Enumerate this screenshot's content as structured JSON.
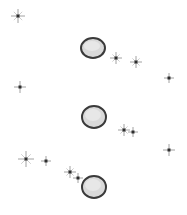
{
  "canvas": {
    "width": 187,
    "height": 215,
    "background": "#ffffff"
  },
  "colors": {
    "disc_rim": "#3a3a3a",
    "disc_fill": "#d9d9d9",
    "disc_highlight": "#ececec",
    "star_core": "#2e2e2e",
    "star_rays": "#8a8a8a"
  },
  "discs": [
    {
      "id": "disc-top",
      "cx": 93,
      "cy": 48,
      "rx": 12,
      "ry": 10
    },
    {
      "id": "disc-middle",
      "cx": 94,
      "cy": 117,
      "rx": 12,
      "ry": 11
    },
    {
      "id": "disc-bottom",
      "cx": 94,
      "cy": 187,
      "rx": 12,
      "ry": 11
    }
  ],
  "stars": [
    {
      "id": "star-1",
      "x": 18,
      "y": 16,
      "size": 7,
      "sparkle": true
    },
    {
      "id": "star-2",
      "x": 116,
      "y": 58,
      "size": 6,
      "sparkle": true
    },
    {
      "id": "star-3",
      "x": 136,
      "y": 62,
      "size": 6,
      "sparkle": true
    },
    {
      "id": "star-4",
      "x": 169,
      "y": 78,
      "size": 5,
      "sparkle": false
    },
    {
      "id": "star-5",
      "x": 20,
      "y": 87,
      "size": 6,
      "sparkle": false
    },
    {
      "id": "star-6",
      "x": 124,
      "y": 130,
      "size": 6,
      "sparkle": true
    },
    {
      "id": "star-7",
      "x": 133,
      "y": 132,
      "size": 5,
      "sparkle": false
    },
    {
      "id": "star-8",
      "x": 169,
      "y": 150,
      "size": 6,
      "sparkle": false
    },
    {
      "id": "star-9",
      "x": 26,
      "y": 159,
      "size": 8,
      "sparkle": true
    },
    {
      "id": "star-10",
      "x": 46,
      "y": 161,
      "size": 5,
      "sparkle": false
    },
    {
      "id": "star-11",
      "x": 70,
      "y": 172,
      "size": 6,
      "sparkle": true
    },
    {
      "id": "star-12",
      "x": 78,
      "y": 178,
      "size": 5,
      "sparkle": false
    }
  ]
}
